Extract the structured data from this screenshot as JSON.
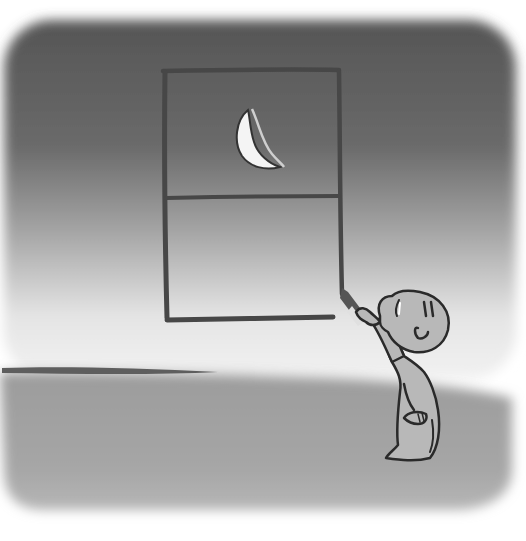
{
  "illustration": {
    "description": "Grayscale illustration of a small child in a nightgown drawing a window with a crescent moon on a dark wall using a crayon",
    "colors": {
      "background_page": "#ffffff",
      "wall_top": "#585858",
      "wall_mid": "#8a8a8a",
      "wall_bottom_glow": "#f0f0f0",
      "floor": "#a4a4a4",
      "window_stroke": "#474747",
      "moon_fill": "#f4f4f4",
      "figure_fill": "#b8b8b8",
      "figure_stroke": "#2a2a2a"
    },
    "elements": [
      "dark-wall",
      "floor",
      "drawn-window",
      "crescent-moon",
      "window-crossbar",
      "crayon",
      "child-figure",
      "horizon-line"
    ]
  }
}
